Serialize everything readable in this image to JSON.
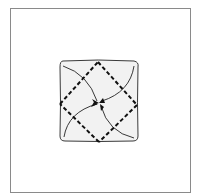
{
  "diagram": {
    "type": "origami-fold-step",
    "colors": {
      "frame": "#8a8a8a",
      "paper_fill": "#f2f2f2",
      "paper_stroke": "#3a3a3a",
      "fold_line": "#111111",
      "arrow": "#222222",
      "background": "#ffffff"
    },
    "fold_lines": [
      "top-right",
      "right-bottom",
      "bottom-left",
      "left-top"
    ],
    "arrows": [
      "top-left-to-center",
      "top-right-to-center",
      "bottom-left-to-center",
      "bottom-right-to-center"
    ]
  }
}
